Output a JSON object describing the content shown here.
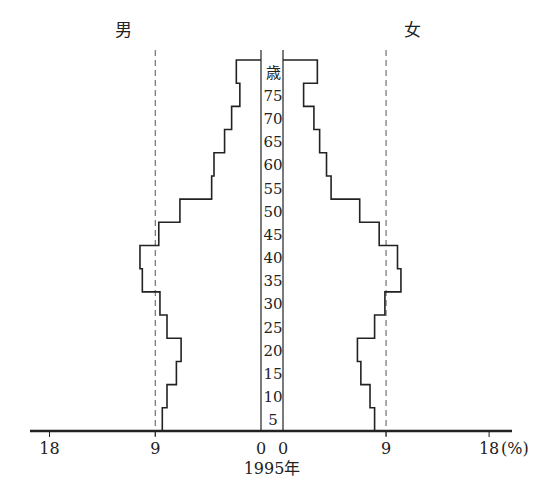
{
  "chart_data": {
    "type": "bar",
    "subtype": "population-pyramid",
    "title": "1995年",
    "xlabel": "(%)",
    "ylabel": "歳",
    "left_series_label": "男",
    "right_series_label": "女",
    "x_ticks_left": [
      "18",
      "9",
      "0"
    ],
    "x_ticks_right": [
      "0",
      "9",
      "18"
    ],
    "x_unit": "(%)",
    "xlim": [
      0,
      18
    ],
    "reference_lines": [
      9
    ],
    "reference_line_style": "dashed",
    "age_labels": [
      "歳",
      "75",
      "70",
      "65",
      "60",
      "55",
      "50",
      "45",
      "40",
      "35",
      "30",
      "25",
      "20",
      "15",
      "10",
      "5"
    ],
    "categories": [
      "75+",
      "70-74",
      "65-69",
      "60-64",
      "55-59",
      "50-54",
      "45-49",
      "40-44",
      "35-39",
      "30-34",
      "25-29",
      "20-24",
      "15-19",
      "10-14",
      "5-9",
      "0-4"
    ],
    "series": [
      {
        "name": "男",
        "side": "left",
        "values": [
          2.1,
          1.8,
          2.5,
          3.1,
          4.0,
          4.2,
          6.9,
          8.7,
          10.3,
          10.1,
          8.6,
          8.0,
          6.8,
          7.2,
          8.0,
          8.4
        ]
      },
      {
        "name": "女",
        "side": "right",
        "values": [
          3.0,
          1.8,
          2.7,
          3.2,
          3.8,
          4.2,
          6.7,
          8.4,
          10.0,
          10.3,
          8.9,
          8.0,
          6.5,
          6.8,
          7.6,
          8.0
        ]
      }
    ],
    "grid": false,
    "legend": "labels above each side"
  }
}
